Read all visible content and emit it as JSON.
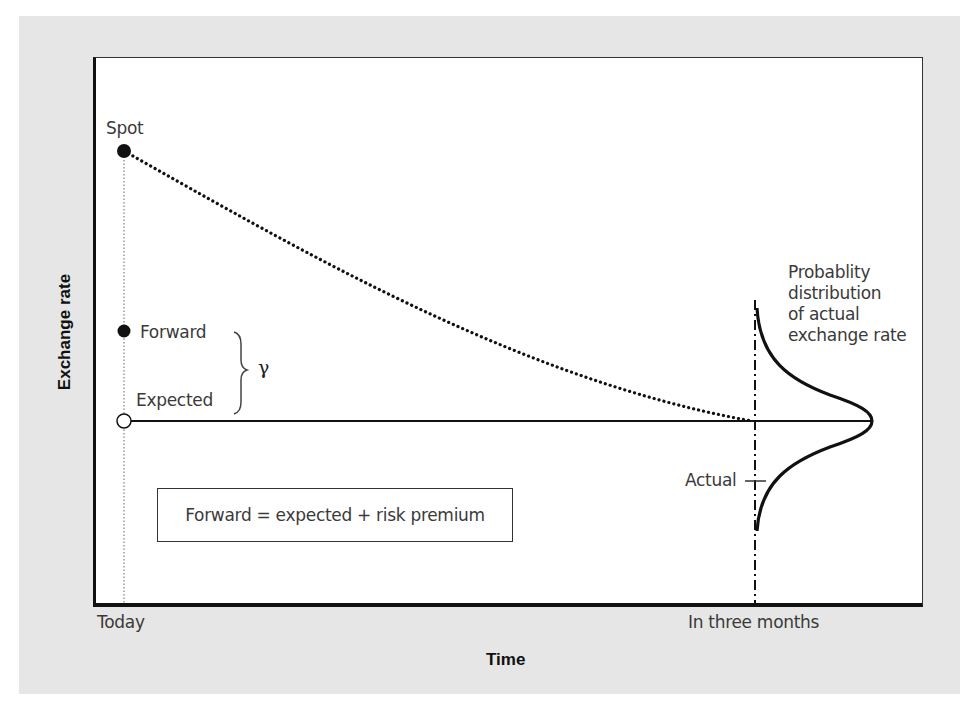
{
  "figure": {
    "y_axis_label": "Exchange rate",
    "x_axis_label": "Time",
    "x_ticks": [
      "Today",
      "In three months"
    ],
    "point_labels": {
      "spot": "Spot",
      "forward": "Forward",
      "expected": "Expected",
      "actual": "Actual",
      "gap_symbol": "γ"
    },
    "distribution_label": [
      "Probablity",
      "distribution",
      "of actual",
      "exchange rate"
    ],
    "equation": "Forward = expected + risk premium",
    "colors": {
      "panel_background": "#e6e6e6",
      "plot_background": "#ffffff",
      "ink": "#111111",
      "label_text": "#3a3a3a"
    }
  }
}
